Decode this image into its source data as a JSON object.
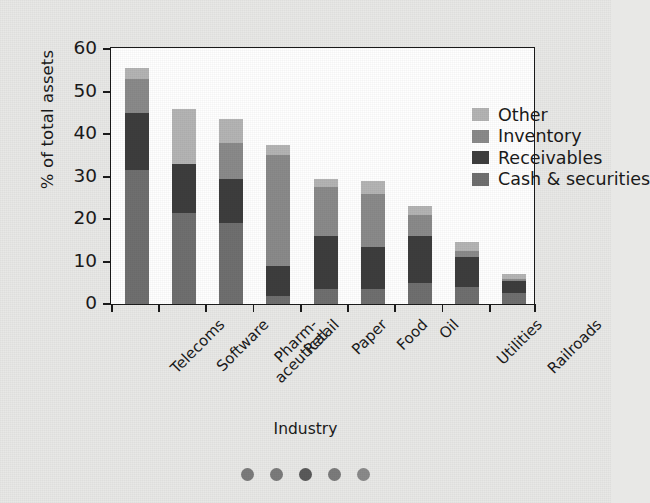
{
  "chart_data": {
    "type": "bar",
    "subtype": "stacked-bar",
    "title": "",
    "xlabel": "Industry",
    "ylabel": "% of total assets",
    "ylim": [
      0,
      60
    ],
    "yticks": [
      0,
      10,
      20,
      30,
      40,
      50,
      60
    ],
    "ytick_labels": [
      "0",
      "10",
      "20",
      "30",
      "40",
      "50",
      "60"
    ],
    "grid": false,
    "legend_position": "top-right",
    "categories": [
      "Telecoms",
      "Software",
      "Pharm-aceutical",
      "Retail",
      "Paper",
      "Food",
      "Oil",
      "Utilities",
      "Railroads"
    ],
    "category_labels": [
      {
        "line1": "Telecoms",
        "line2": ""
      },
      {
        "line1": "Software",
        "line2": ""
      },
      {
        "line1": "Pharm-",
        "line2": "aceutical"
      },
      {
        "line1": "Retail",
        "line2": ""
      },
      {
        "line1": "Paper",
        "line2": ""
      },
      {
        "line1": "Food",
        "line2": ""
      },
      {
        "line1": "Oil",
        "line2": ""
      },
      {
        "line1": "Utilities",
        "line2": ""
      },
      {
        "line1": "Railroads",
        "line2": ""
      }
    ],
    "series": [
      {
        "name": "Cash & securities",
        "color": "#6f6f6f",
        "values": [
          31.5,
          21.5,
          19.0,
          2.0,
          3.5,
          3.5,
          5.0,
          4.0,
          2.5
        ]
      },
      {
        "name": "Receivables",
        "color": "#3d3d3d",
        "values": [
          13.5,
          11.5,
          10.5,
          7.0,
          12.5,
          10.0,
          11.0,
          7.0,
          3.0
        ]
      },
      {
        "name": "Inventory",
        "color": "#8a8a8a",
        "values": [
          8.0,
          0.0,
          8.5,
          26.0,
          11.5,
          12.5,
          5.0,
          1.5,
          0.5
        ]
      },
      {
        "name": "Other",
        "color": "#b4b4b4",
        "values": [
          2.5,
          13.0,
          5.5,
          2.5,
          2.0,
          3.0,
          2.0,
          2.0,
          1.0
        ]
      }
    ],
    "legend_order": [
      "Other",
      "Inventory",
      "Receivables",
      "Cash & securities"
    ],
    "totals": [
      55.5,
      46.0,
      43.5,
      37.5,
      29.5,
      29.0,
      23.0,
      14.5,
      7.0
    ]
  },
  "legend": {
    "items": [
      {
        "label": "Other",
        "color": "#b4b4b4"
      },
      {
        "label": "Inventory",
        "color": "#8a8a8a"
      },
      {
        "label": "Receivables",
        "color": "#3d3d3d"
      },
      {
        "label": "Cash & securities",
        "color": "#6f6f6f"
      }
    ]
  },
  "decoration": {
    "dots_count": 5,
    "dots_colors": [
      "#7b7b7b",
      "#7b7b7b",
      "#5a5a5a",
      "#7b7b7b",
      "#8a8a8a"
    ]
  },
  "style": {
    "page_background": "#e8e8e6",
    "plot_background": "#ffffff",
    "axis_color": "#1b1b1b",
    "text_color": "#1a1a1a"
  }
}
